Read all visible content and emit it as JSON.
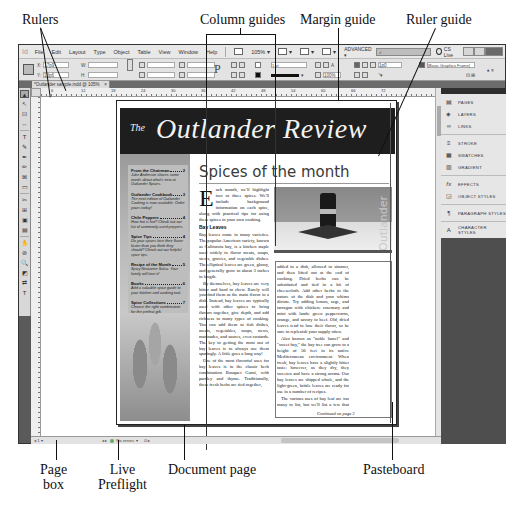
{
  "callouts": {
    "rulers": "Rulers",
    "column_guides": "Column guides",
    "margin_guide": "Margin guide",
    "ruler_guide": "Ruler guide",
    "page_box_line1": "Page",
    "page_box_line2": "box",
    "live_preflight_line1": "Live",
    "live_preflight_line2": "Preflight",
    "document_page": "Document page",
    "pasteboard": "Pasteboard"
  },
  "menubar": {
    "logo": "Id",
    "items": [
      "File",
      "Edit",
      "Layout",
      "Type",
      "Object",
      "Table",
      "View",
      "Window",
      "Help"
    ],
    "zoom": "105%",
    "workspace": "ADVANCED",
    "search_placeholder": "",
    "cs_live": "CS Live"
  },
  "control": {
    "x_label": "X:",
    "x_value": "17p9",
    "y_label": "Y:",
    "y_value": "10p6",
    "w_label": "W:",
    "h_label": "H:",
    "stroke_weight": "1 pt",
    "opacity": "100%",
    "gutter": "1p0",
    "object_style": "[Basic Graphics Frame]"
  },
  "document_tab": {
    "title": "*Outlander sample.indd @ 105%",
    "close": "×"
  },
  "tools": [
    "▲",
    "↖",
    "⊡",
    "↔",
    "T",
    "✎",
    "✒",
    "✏",
    "⊠",
    "▭",
    "✂",
    "⊞",
    "▣",
    "▤",
    "✋",
    "⊘",
    "🔍",
    "◩",
    "⇄",
    "T"
  ],
  "rulers": {
    "h_labels": [
      "0",
      "6",
      "12",
      "18",
      "24",
      "30",
      "36",
      "42",
      "48",
      "54",
      "60",
      "66",
      "72"
    ]
  },
  "newsletter": {
    "masthead_the": "The",
    "masthead_title": "Outlander Review",
    "toc": [
      {
        "title": "From the Chairman",
        "page": "2",
        "desc": "Jake Anderson shares some words about what's new at Outlander Spices."
      },
      {
        "title": "Outlander Cookbook",
        "page": "3",
        "desc": "The next edition of Outlander Cooking is now available. Order yours today!"
      },
      {
        "title": "Chile Peppers",
        "page": "4",
        "desc": "How hot is hot? Check out our list of commonly used peppers."
      },
      {
        "title": "Spice Tips",
        "page": "4",
        "desc": "Do your spices lose their flavor faster than you think they should? Check out our helpful spice tips."
      },
      {
        "title": "Recipe of the Month",
        "page": "5",
        "desc": "Spicy Nectarine Salsa. Your family will love it!"
      },
      {
        "title": "Books",
        "page": "6",
        "desc": "Add a valuable spice guide to your kitchen and cooking tool."
      },
      {
        "title": "Spice Collections",
        "page": "7",
        "desc": "Choose the right combination for the perfect gift."
      }
    ],
    "article_title": "Spices of the month",
    "dropcap": "E",
    "intro": "ach month, we'll highlight two or three spices. We'll include background information on each spice, along with practical tips for using these spices in your own cooking.",
    "subhead": "Bay Leaves",
    "col1_paras": [
      "Bay leaves come in many varieties. The popular American variety, known as California bay, is a kitchen staple used widely to flavor meats, soups, stews, gravies, and vegetable dishes. The elliptical leaves are green, glossy, and generally grow to about 3 inches in length.",
      "By themselves, bay leaves are very bitter and hard to chew. Rarely will you find them as the main flavor in a dish. Instead, bay leaves are typically used with other spices to bring flavors together, give depth, and add richness to many types of cooking. You can add them to fish dishes, meats, vegetables, soups, stews, marinades, and sauces, even custards. The key to getting the most out of bay leaves is to always use them sparingly. A little goes a long way!",
      "One of the most flavorful uses for bay leaves is in the classic herb combination Bouquet Garni, with parsley and thyme. Traditionally, these fresh herbs are tied together,"
    ],
    "col2_paras": [
      "added to a dish, allowed to simmer, and then lifted out at the end of cooking. Dried herbs can be substituted and tied in a bit of cheesecloth. Add other herbs to the nature of the dish and your whims dictate. Try adding lemon, sage, and tarragon with chicken; rosemary and mint with lamb; green peppercorns, orange, and savory to beef. Old, dried leaves tend to lose their flavor, so be sure to replenish your supply often.",
      "Also known as \"noble laurel\" and \"sweet bay,\" the bay tree can grow to a height of 50 feet in its native Mediterranean environment. When fresh, bay leaves have a slightly bitter taste; however, as they dry, they sweeten and have a strong aroma. Our bay leaves are shipped whole, and the light-green, brittle leaves are ready for use in a number of recipes.",
      "The various uses of bay leaf are too many to list, but we'll list a few that you'll find especially welcome"
    ],
    "continued": "Continued on page 3",
    "photo_vertical_text": "Outlander"
  },
  "dock": {
    "groups": [
      [
        {
          "icon": "▤",
          "label": "PAGES"
        },
        {
          "icon": "◈",
          "label": "LAYERS"
        },
        {
          "icon": "∞",
          "label": "LINKS"
        }
      ],
      [
        {
          "icon": "≡",
          "label": "STROKE"
        },
        {
          "icon": "▦",
          "label": "SWATCHES"
        },
        {
          "icon": "▥",
          "label": "GRADIENT"
        }
      ],
      [
        {
          "icon": "fx",
          "label": "EFFECTS"
        },
        {
          "icon": "◲",
          "label": "OBJECT STYLES"
        }
      ],
      [
        {
          "icon": "¶",
          "label": "PARAGRAPH STYLES"
        }
      ],
      [
        {
          "icon": "A",
          "label": "CHARACTER STYLES"
        }
      ]
    ]
  },
  "statusbar": {
    "page_box": "1",
    "nav_arrows": "◂ ▸",
    "preflight": "No errors",
    "preflight_color": "#66aa66"
  }
}
